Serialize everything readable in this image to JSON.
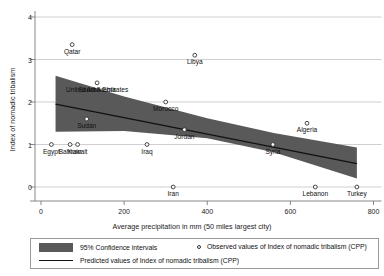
{
  "chart_data": {
    "type": "scatter",
    "title": "",
    "xlabel": "Average precipitation in mm (50 miles largest city)",
    "ylabel": "Index of nomadic tribalism",
    "xlim": [
      -20,
      820
    ],
    "ylim": [
      -0.45,
      4.3
    ],
    "xticks": [
      0,
      200,
      400,
      600,
      800
    ],
    "yticks": [
      0,
      1,
      2,
      3,
      4
    ],
    "grid": "horizontal",
    "legend_position": "below-axis",
    "points": [
      {
        "label": "Qatar",
        "x": 75,
        "y": 3.35
      },
      {
        "label": "Libya",
        "x": 370,
        "y": 3.1
      },
      {
        "label": "United Arab Emirates",
        "x": 135,
        "y": 2.45
      },
      {
        "label": "Saudi Arabia",
        "x": 135,
        "y": 2.45
      },
      {
        "label": "Morocco",
        "x": 300,
        "y": 2.0
      },
      {
        "label": "Sudan",
        "x": 110,
        "y": 1.6
      },
      {
        "label": "Jordan",
        "x": 345,
        "y": 1.35
      },
      {
        "label": "Algeria",
        "x": 640,
        "y": 1.5
      },
      {
        "label": "Egypt",
        "x": 25,
        "y": 1.0
      },
      {
        "label": "Bahrain",
        "x": 70,
        "y": 1.0
      },
      {
        "label": "Kuwait",
        "x": 88,
        "y": 1.0
      },
      {
        "label": "Iraq",
        "x": 255,
        "y": 1.0
      },
      {
        "label": "Syria",
        "x": 558,
        "y": 1.0
      },
      {
        "label": "Iran",
        "x": 318,
        "y": 0.0
      },
      {
        "label": "Lebanon",
        "x": 660,
        "y": 0.0
      },
      {
        "label": "Turkey",
        "x": 760,
        "y": 0.0
      }
    ],
    "fit_line": {
      "name": "Predicted values of Index of nomadic tribalism (CPP)",
      "x": [
        35,
        760
      ],
      "y": [
        1.95,
        0.55
      ]
    },
    "confidence_band": {
      "name": "95% Confidence intervals",
      "level": "95%",
      "x": [
        35,
        200,
        400,
        560,
        760
      ],
      "upper": [
        2.62,
        2.13,
        1.62,
        1.27,
        0.93
      ],
      "lower": [
        1.3,
        1.32,
        1.15,
        0.82,
        0.2
      ]
    },
    "colors": {
      "band": "#595959",
      "line": "#111111",
      "grid": "#c9c9c9",
      "axis": "#7a7a7a",
      "marker_edge": "#333333"
    }
  },
  "legend": {
    "band_label": "95% Confidence intervals",
    "points_label": "Observed values of Index of nomadic tribalism (CPP)",
    "line_label": "Predicted values of Index of nomadic tribalism (CPP)"
  }
}
